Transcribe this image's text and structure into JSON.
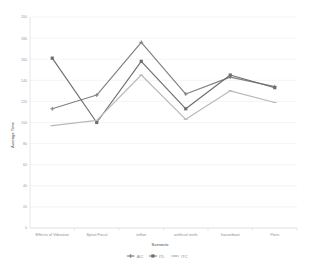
{
  "chart_data": {
    "type": "line",
    "title": "",
    "xlabel": "Scenario",
    "ylabel": "Average Time",
    "categories": [
      "Effects of Vibration",
      "Spiral Focal",
      "teflon",
      "artificial reefs",
      "houseboat",
      "Piers"
    ],
    "ylim": [
      0,
      200
    ],
    "yticks": [
      0,
      20,
      40,
      60,
      80,
      100,
      120,
      140,
      160,
      180,
      200
    ],
    "ytick_labels": [
      "0",
      "20",
      "40",
      "60",
      "80",
      "100",
      "120",
      "140",
      "160",
      "180",
      "200"
    ],
    "grid": true,
    "legend_position": "bottom",
    "series": [
      {
        "name": "AIC",
        "color": "#808080",
        "marker": "cross",
        "values": [
          113,
          126,
          176,
          127,
          143,
          134
        ]
      },
      {
        "name": "ITL",
        "color": "#6e6e6e",
        "marker": "square",
        "values": [
          161,
          100,
          158,
          113,
          145,
          133
        ]
      },
      {
        "name": "ITC",
        "color": "#b9b9b9",
        "marker": "dash",
        "values": [
          97,
          102,
          145,
          103,
          130,
          119
        ]
      }
    ]
  },
  "colors": {
    "background": "#ffffff",
    "grid": "#e9e9e9",
    "axis": "#d6d6d6",
    "tick_text": "#9a9a9a",
    "title_text": "#7d7d7d"
  }
}
